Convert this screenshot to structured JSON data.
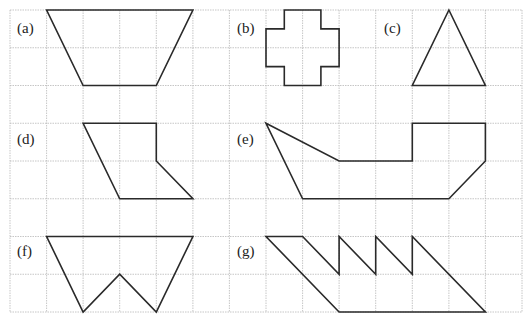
{
  "grid": {
    "x_lines": [
      10,
      46.6,
      83.1,
      119.7,
      156.3,
      192.9,
      229.4,
      266,
      302.6,
      339.1,
      375.7,
      412.3,
      448.9,
      485.4,
      522
    ],
    "y_lines": [
      10,
      47.75,
      85.5,
      123.25,
      161,
      198.75,
      236.5,
      274.25,
      312
    ],
    "color": "#b8b8b8"
  },
  "shapes": [
    {
      "id": "a",
      "label": "(a)",
      "label_pos": [
        17,
        33
      ],
      "points": "46.6,10 192.9,10 156.3,85.5 83.1,85.5"
    },
    {
      "id": "b",
      "label": "(b)",
      "label_pos": [
        237,
        33
      ],
      "points": "284.3,10 320.9,10 320.9,28.9 339.1,28.9 339.1,66.6 320.9,66.6 320.9,85.5 284.3,85.5 284.3,66.6 266,66.6 266,28.9 284.3,28.9"
    },
    {
      "id": "c",
      "label": "(c)",
      "label_pos": [
        384,
        33
      ],
      "points": "448.9,10 485.4,85.5 412.3,85.5"
    },
    {
      "id": "d",
      "label": "(d)",
      "label_pos": [
        17,
        144
      ],
      "points": "83.1,123.25 156.3,123.25 156.3,161 192.9,198.75 119.7,198.75"
    },
    {
      "id": "e",
      "label": "(e)",
      "label_pos": [
        237,
        144
      ],
      "points": "266,123.25 339.1,161 412.3,161 412.3,123.25 485.4,123.25 485.4,161 448.9,198.75 302.6,198.75"
    },
    {
      "id": "f",
      "label": "(f)",
      "label_pos": [
        17,
        256
      ],
      "points": "46.6,236.5 192.9,236.5 156.3,312 119.7,274.25 83.1,312"
    },
    {
      "id": "g",
      "label": "(g)",
      "label_pos": [
        237,
        256
      ],
      "points": "266,236.5 302.6,236.5 339.1,274.25 339.1,236.5 375.7,274.25 375.7,236.5 412.3,274.25 412.3,236.5 485.4,312 339.1,312"
    }
  ]
}
